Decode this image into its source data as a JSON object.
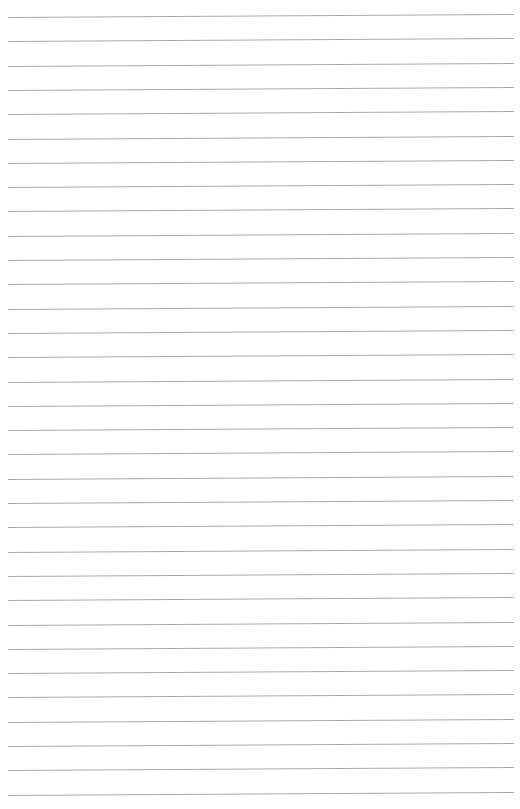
{
  "page": {
    "type": "blank lined paper",
    "line_color": "#a9a9a9",
    "background": "#ffffff",
    "line_count": 33,
    "first_line_y": 17,
    "line_spacing": 24.3
  }
}
